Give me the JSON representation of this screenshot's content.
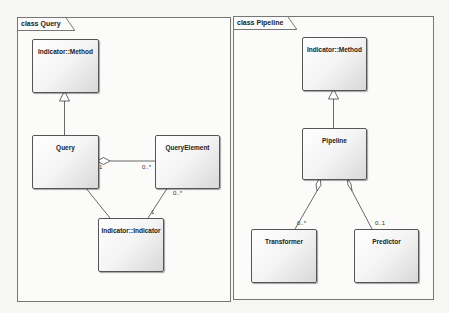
{
  "frames": [
    {
      "title": "class Query",
      "classes": [
        "Indicator::Method",
        "Query",
        "QueryElement",
        "Indicator::Indicator"
      ],
      "multiplicities": {
        "query_end": "1",
        "queryelement_end": "0..*",
        "qe_to_indicator_qe": "0..*",
        "qe_to_indicator_ind": "1"
      }
    },
    {
      "title": "class Pipeline",
      "classes": [
        "Indicator::Method",
        "Pipeline",
        "Transformer",
        "Predictor"
      ],
      "multiplicities": {
        "transformer": "0..*",
        "predictor": "0..1"
      }
    }
  ],
  "colors": {
    "border": "#555555",
    "frame": "#777777",
    "background": "#f6f6f4"
  }
}
